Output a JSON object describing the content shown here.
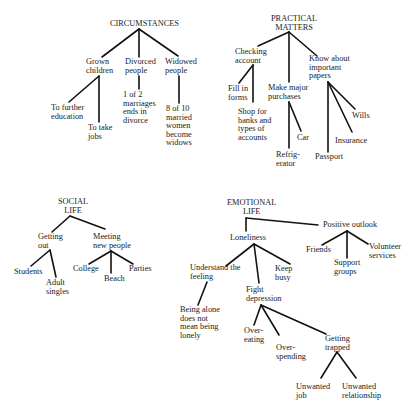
{
  "diagram": {
    "circumstances": {
      "title": "CIRCUMSTANCES",
      "grown_children": "Grown\nchildren",
      "further_education": "To further\neducation",
      "take_jobs": "To take\njobs",
      "divorced": "Divorced\npeople",
      "divorce_stat": "1 of 2\nmarriages\nends in\ndivorce",
      "widowed": "Widowed\npeople",
      "widow_stat": "8 of 10\nmarried\nwomen\nbecome\nwidows"
    },
    "practical": {
      "title": "PRACTICAL\nMATTERS",
      "checking": "Checking\naccount",
      "fill_forms": "Fill in\nforms",
      "shop_banks": "Shop for\nbanks and\ntypes of\naccounts",
      "purchases": "Make major\npurchases",
      "refrigerator": "Refrig-\nerator",
      "car": "Car",
      "papers": "Know about\nimportant\npapers",
      "passport": "Passport",
      "insurance": "Insurance",
      "wills": "Wills"
    },
    "social": {
      "title": "SOCIAL\nLIFE",
      "getting_out": "Getting\nout",
      "students": "Students",
      "adult_singles": "Adult\nsingles",
      "meeting": "Meeting\nnew people",
      "college": "College",
      "beach": "Beach",
      "parties": "Parties"
    },
    "emotional": {
      "title": "EMOTIONAL\nLIFE",
      "loneliness": "Loneliness",
      "understand": "Understand the\nfeeling",
      "being_alone": "Being alone\ndoes not\nmean being\nlonely",
      "keep_busy": "Keep\nbusy",
      "fight_depression": "Fight\ndepression",
      "overeating": "Over-\neating",
      "overspending": "Over-\nspending",
      "trapped": "Getting\ntrapped",
      "unwanted_job": "Unwanted\njob",
      "unwanted_relationship": "Unwanted\nrelationship",
      "positive": "Positive outlook",
      "friends": "Friends",
      "support": "Support\ngroups",
      "volunteer": "Volunteer\nservices"
    }
  }
}
